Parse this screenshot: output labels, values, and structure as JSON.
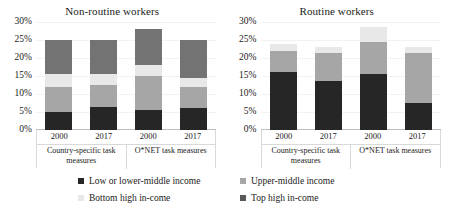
{
  "chart_data": {
    "type": "bar",
    "title": "",
    "subtitle": "",
    "xlabel": "",
    "ylabel": "",
    "ylim": [
      0,
      0.3
    ],
    "ytick_labels": [
      "0%",
      "5%",
      "10%",
      "15%",
      "20%",
      "25%",
      "30%"
    ],
    "ytick_values": [
      0,
      5,
      10,
      15,
      20,
      25,
      30
    ],
    "grid": true,
    "stacked": true,
    "legend_position": "bottom",
    "series_names": [
      "Low or lower-middle income",
      "Upper-middle income",
      "Bottom high in-come",
      "Top high in-come"
    ],
    "series_colors": [
      "#262626",
      "#a6a6a6",
      "#e8e8e8",
      "#737373"
    ],
    "panels": [
      {
        "title": "Non-routine workers",
        "categories": [
          "2000",
          "2017",
          "2000",
          "2017"
        ],
        "groups": [
          "Country-specific task measures",
          "O*NET task measures"
        ],
        "series": [
          {
            "name": "Low or lower-middle income",
            "values": [
              5.0,
              6.5,
              5.5,
              6.0
            ]
          },
          {
            "name": "Upper-middle income",
            "values": [
              7.0,
              6.0,
              9.5,
              6.0
            ]
          },
          {
            "name": "Bottom high in-come",
            "values": [
              3.5,
              3.0,
              3.0,
              2.5
            ]
          },
          {
            "name": "Top high in-come",
            "values": [
              9.5,
              9.5,
              10.0,
              10.5
            ]
          }
        ],
        "totals": [
          25.0,
          25.0,
          28.0,
          25.0
        ]
      },
      {
        "title": "Routine workers",
        "categories": [
          "2000",
          "2017",
          "2000",
          "2017"
        ],
        "groups": [
          "Country-specific task measures",
          "O*NET task measures"
        ],
        "series": [
          {
            "name": "Low or lower-middle income",
            "values": [
              16.0,
              13.5,
              15.5,
              7.5
            ]
          },
          {
            "name": "Upper-middle income",
            "values": [
              6.0,
              8.0,
              9.0,
              14.0
            ]
          },
          {
            "name": "Bottom high in-come",
            "values": [
              2.0,
              1.5,
              4.0,
              1.5
            ]
          },
          {
            "name": "Top high in-come",
            "values": [
              0.0,
              0.0,
              0.0,
              0.0
            ]
          }
        ],
        "totals": [
          24.0,
          23.0,
          28.5,
          23.0
        ]
      }
    ]
  },
  "legend": {
    "items": [
      {
        "label": "Low or lower-middle income",
        "color": "#262626"
      },
      {
        "label": "Upper-middle income",
        "color": "#a6a6a6"
      },
      {
        "label": "Bottom high in-come",
        "color": "#e8e8e8"
      },
      {
        "label": "Top high in-come",
        "color": "#595959"
      }
    ]
  }
}
